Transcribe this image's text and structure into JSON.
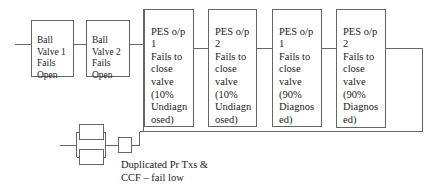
{
  "diagram": {
    "type": "reliability-block-diagram",
    "colors": {
      "line": "#666666",
      "text": "#222222",
      "background": "#ffffff"
    },
    "series_chain": [
      {
        "id": "ball-valve-1",
        "label": "Ball\nValve 1\nFails\nOpen"
      },
      {
        "id": "ball-valve-2",
        "label": "Ball\nValve 2\nFails\nOpen"
      }
    ],
    "parallel_branches": [
      {
        "id": "pes-op1-undiag",
        "label": "PES o/p\n1\nFails to\nclose\nvalve\n(10%\nUndiagn\nosed)"
      },
      {
        "id": "pes-op2-undiag",
        "label": "PES o/p\n2\nFails to\nclose\nvalve\n(10%\nUndiagn\nosed)"
      },
      {
        "id": "pes-op1-diag",
        "label": "PES o/p\n1\nFails to\nclose\nvalve\n(90%\nDiagnos\ned)"
      },
      {
        "id": "pes-op2-diag",
        "label": "PES o/p\n2\nFails to\nclose\nvalve\n(90%\nDiagnos\ned)"
      }
    ],
    "lower_branch": {
      "caption": "Duplicated Pr Txs &\nCCF – fail low",
      "parallel_blocks": 2,
      "series_blocks": 1
    }
  }
}
